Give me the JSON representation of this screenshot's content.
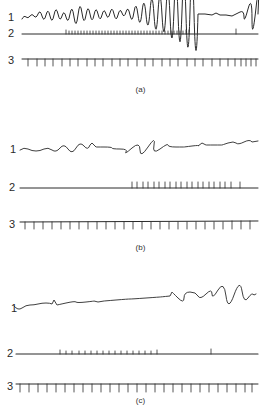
{
  "figure": {
    "panels": [
      {
        "id": "a",
        "caption": "(a)",
        "traces": [
          {
            "label": "1",
            "description": "oscillating waveform, larger oscillations mid-to-late, large burst at far right"
          },
          {
            "label": "2",
            "description": "baseline with dense spike train from left-center to ~70%, single isolated spike near right end"
          },
          {
            "label": "3",
            "description": "time-marker line with evenly spaced downward ticks"
          }
        ]
      },
      {
        "id": "b",
        "caption": "(b)",
        "traces": [
          {
            "label": "1",
            "description": "low-amplitude irregular waveform, slowly rising toward right"
          },
          {
            "label": "2",
            "description": "flat baseline, spike train begins at ~mid and continues to ~90%"
          },
          {
            "label": "3",
            "description": "time-marker line with evenly spaced downward ticks"
          }
        ]
      },
      {
        "id": "c",
        "caption": "(c)",
        "traces": [
          {
            "label": "1",
            "description": "slowly rising baseline, oscillations appear in right third"
          },
          {
            "label": "2",
            "description": "baseline with small spike train in left-center region, single isolated spike right of center"
          },
          {
            "label": "3",
            "description": "time-marker line with evenly spaced downward ticks"
          }
        ]
      }
    ]
  }
}
